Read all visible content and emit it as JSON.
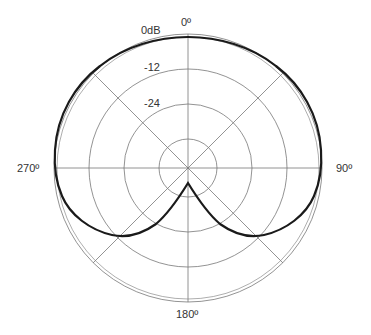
{
  "diagram": {
    "type": "polar-pickup-pattern",
    "pattern_shape": "cardioid",
    "angle_labels": {
      "top": "0º",
      "right": "90º",
      "bottom": "180º",
      "left": "270º"
    },
    "level_labels": {
      "ring_0": "0dB",
      "ring_1": "-12",
      "ring_2": "-24"
    },
    "colors": {
      "grid": "#777777",
      "curve": "#1a1a1a",
      "text": "#333333"
    }
  }
}
